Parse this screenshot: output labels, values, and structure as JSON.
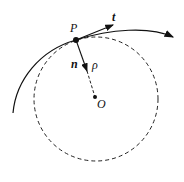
{
  "diagram": {
    "labels": {
      "point": "P",
      "tangent": "t",
      "normal": "n",
      "radius": "ρ",
      "center": "O"
    },
    "elements": [
      "curve",
      "osculating-circle",
      "tangent-vector",
      "normal-vector",
      "radius-line",
      "point-P",
      "center-O"
    ]
  }
}
